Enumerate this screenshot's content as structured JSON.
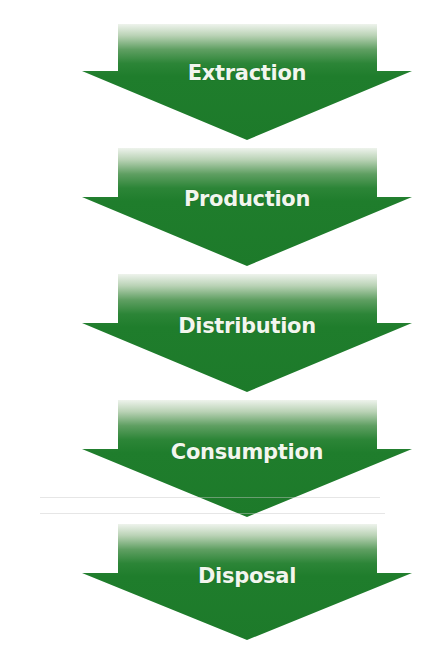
{
  "diagram": {
    "type": "vertical-flow",
    "direction": "top-to-bottom",
    "colors": {
      "arrow_fill": "#1f7d2c",
      "arrow_top_fade": "#e8efe6",
      "label_text": "#f2f6ee",
      "background": "#ffffff"
    },
    "steps": [
      {
        "label": "Extraction"
      },
      {
        "label": "Production"
      },
      {
        "label": "Distribution"
      },
      {
        "label": "Consumption"
      },
      {
        "label": "Disposal"
      }
    ]
  }
}
